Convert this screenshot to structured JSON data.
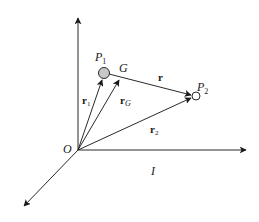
{
  "diagram": {
    "origin_label": "O",
    "frame_label": "I",
    "points": {
      "p1": {
        "name": "P",
        "subscript": "1"
      },
      "g": {
        "name": "G"
      },
      "p2": {
        "name": "P",
        "subscript": "2"
      }
    },
    "vectors": {
      "r1": {
        "name": "r",
        "subscript": "1",
        "from": "O",
        "to": "P1"
      },
      "rG": {
        "name": "r",
        "subscript": "G",
        "from": "O",
        "to": "G"
      },
      "r2": {
        "name": "r",
        "subscript": "2",
        "from": "O",
        "to": "P2"
      },
      "r": {
        "name": "r",
        "from": "P1",
        "to": "P2"
      }
    },
    "axes": [
      "vertical",
      "horizontal",
      "diagonal"
    ],
    "colors": {
      "ink": "#1a1a1a",
      "particle_fill": "#c8c8c8",
      "background": "#ffffff"
    }
  }
}
